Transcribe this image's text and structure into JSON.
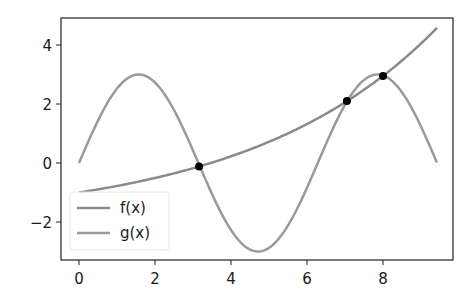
{
  "chart_data": {
    "type": "line",
    "title": "",
    "xlabel": "",
    "ylabel": "",
    "xlim": [
      -0.47,
      9.84
    ],
    "ylim": [
      -3.29,
      4.92
    ],
    "grid": false,
    "legend_position": "lower left",
    "x_ticks": [
      0,
      2,
      4,
      6,
      8
    ],
    "x_tick_labels": [
      "0",
      "2",
      "4",
      "6",
      "8"
    ],
    "y_ticks": [
      -2,
      0,
      2,
      4
    ],
    "y_tick_labels": [
      "−2",
      "0",
      "2",
      "4"
    ],
    "series": [
      {
        "name": "f(x)",
        "color": "#8a8a8a",
        "formula": "exp(x/5) - 2",
        "x": [
          0,
          0.5,
          1,
          1.5,
          2,
          2.5,
          3,
          3.5,
          4,
          4.5,
          5,
          5.5,
          6,
          6.5,
          7,
          7.5,
          8,
          8.5,
          9,
          9.42
        ],
        "values": [
          -1.0,
          -0.895,
          -0.779,
          -0.65,
          -0.508,
          -0.351,
          -0.178,
          0.014,
          0.226,
          0.46,
          0.718,
          1.004,
          1.32,
          1.669,
          2.055,
          2.482,
          2.953,
          3.474,
          4.05,
          4.586
        ]
      },
      {
        "name": "g(x)",
        "color": "#9a9a9a",
        "formula": "3*sin(x)",
        "x": [
          0,
          0.5,
          1,
          1.5,
          2,
          2.5,
          3,
          3.5,
          4,
          4.5,
          5,
          5.5,
          6,
          6.5,
          7,
          7.5,
          8,
          8.5,
          9,
          9.42
        ],
        "values": [
          0.0,
          1.438,
          2.524,
          2.992,
          2.728,
          1.795,
          0.423,
          -1.052,
          -2.27,
          -2.933,
          -2.877,
          -2.114,
          -0.838,
          0.645,
          1.971,
          2.81,
          2.968,
          2.395,
          1.236,
          0.0
        ]
      }
    ],
    "intersections": [
      {
        "x": 3.16,
        "y": -0.12
      },
      {
        "x": 7.05,
        "y": 2.1
      },
      {
        "x": 8.0,
        "y": 2.95
      }
    ],
    "intersection_color": "#000000"
  },
  "legend": {
    "items": [
      {
        "label": "f(x)",
        "color": "#8a8a8a"
      },
      {
        "label": "g(x)",
        "color": "#9a9a9a"
      }
    ]
  }
}
